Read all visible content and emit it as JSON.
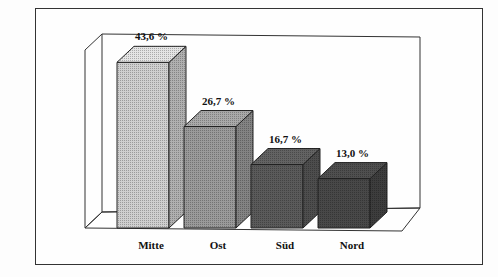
{
  "chart_data": {
    "type": "bar",
    "title": "",
    "xlabel": "",
    "ylabel": "",
    "categories": [
      "Mitte",
      "Ost",
      "Süd",
      "Nord"
    ],
    "values": [
      43.6,
      26.7,
      16.7,
      13.0
    ],
    "value_labels": [
      "43,6 %",
      "26,7 %",
      "16,7 %",
      "13,0 %"
    ],
    "unit": "%",
    "style": "3d-bar",
    "grid": false,
    "legend": "none",
    "colors": [
      "#cfcfcf",
      "#9a9a9a",
      "#5a5a5a",
      "#484848"
    ]
  }
}
